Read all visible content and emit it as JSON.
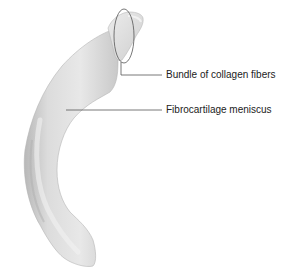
{
  "figure": {
    "subject": "meniscus",
    "labels": [
      {
        "text": "Bundle of collagen fibers",
        "x": 166,
        "y": 69
      },
      {
        "text": "Fibrocartilage meniscus",
        "x": 166,
        "y": 104
      }
    ],
    "colors": {
      "background": "#ffffff",
      "tissue_light": "#e6e6e6",
      "tissue_mid": "#cfcfcf",
      "tissue_dark": "#a8a8a8",
      "leader_line": "#555555",
      "text": "#222222"
    }
  }
}
